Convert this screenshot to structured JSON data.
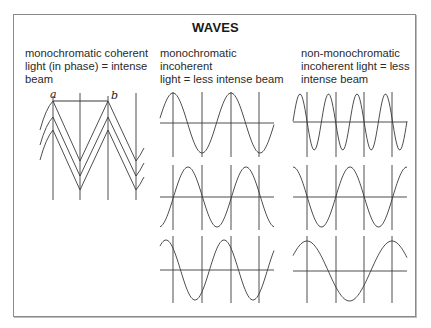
{
  "title": "WAVES",
  "panels": [
    {
      "id": "coherent",
      "caption": "monochromatic coherent\nlight (in phase) = intense\nbeam",
      "labels": [
        "a",
        "b"
      ],
      "description": "three in-phase triangular waves stacked; reference verticals at peaks/troughs"
    },
    {
      "id": "mono-incoherent",
      "caption": "monochromatic incoherent\nlight = less intense beam",
      "description": "three sine waves of equal wavelength, different phases"
    },
    {
      "id": "non-mono-incoherent",
      "caption": "non-monochromatic\nincoherent light = less\nintense beam",
      "description": "three sine waves of different wavelengths"
    }
  ],
  "colors": {
    "line": "#3a3a3a",
    "frame": "#8a8a8a",
    "text": "#2a2a2a"
  }
}
